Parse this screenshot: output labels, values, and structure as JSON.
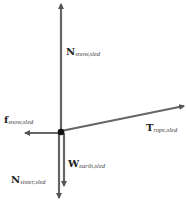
{
  "diagram": {
    "type": "free-body diagram",
    "origin": {
      "x": 61,
      "y": 131
    },
    "colors": {
      "arrow": "#555555",
      "dot": "#111111",
      "text": "#222222"
    },
    "vectors": [
      {
        "id": "n-snow",
        "symbol": "N",
        "subscript": "snow,sled",
        "from": [
          61,
          131
        ],
        "to": [
          61,
          3
        ],
        "label_pos": [
          66,
          55
        ]
      },
      {
        "id": "t-rope",
        "symbol": "T",
        "subscript": "rope,sled",
        "from": [
          61,
          131
        ],
        "to": [
          185,
          106
        ],
        "label_pos": [
          146,
          131
        ]
      },
      {
        "id": "f-snow",
        "symbol": "f",
        "subscript": "snow,sled",
        "from": [
          61,
          133
        ],
        "to": [
          24,
          133
        ],
        "label_pos": [
          4,
          123
        ]
      },
      {
        "id": "w-earth",
        "symbol": "W",
        "subscript": "earth,sled",
        "from": [
          64,
          133
        ],
        "to": [
          64,
          187
        ],
        "label_pos": [
          68,
          167
        ]
      },
      {
        "id": "n-sister",
        "symbol": "N",
        "subscript": "sister,sled",
        "from": [
          59,
          133
        ],
        "to": [
          59,
          199
        ],
        "label_pos": [
          11,
          183
        ]
      }
    ]
  },
  "labels": {
    "n_snow": {
      "main": "N",
      "sub": "snow,sled"
    },
    "t_rope": {
      "main": "T",
      "sub": "rope,sled"
    },
    "f_snow": {
      "main": "f",
      "sub": "snow,sled"
    },
    "w_earth": {
      "main": "W",
      "sub": "earth,sled"
    },
    "n_sister": {
      "main": "N",
      "sub": "sister,sled"
    }
  }
}
